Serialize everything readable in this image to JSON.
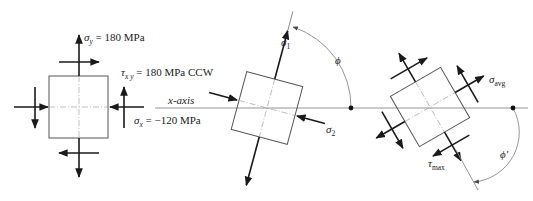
{
  "diagram": {
    "original_element": {
      "sigma_y_label": "σ",
      "sigma_y_sub": "y",
      "sigma_y_value": " = 180 MPa",
      "tau_xy_label": "τ",
      "tau_xy_sub": "x y",
      "tau_xy_value": " = 180 MPa CCW",
      "sigma_x_label": "σ",
      "sigma_x_sub": "x",
      "sigma_x_value": " = −120 MPa"
    },
    "axis": {
      "label": "x-axis"
    },
    "principal_element": {
      "sigma1_label": "σ",
      "sigma1_sub": "1",
      "sigma2_label": "σ",
      "sigma2_sub": "2",
      "angle_label": "ϕ"
    },
    "shear_element": {
      "sigma_avg_label": "σ",
      "sigma_avg_sub": "avg",
      "tau_max_label": "τ",
      "tau_max_sub": "max",
      "angle_label": "ϕ",
      "angle_prime": "′"
    },
    "colors": {
      "ink": "#1a1a1a",
      "element_outline": "#555555",
      "guide_lines": "#999999"
    }
  }
}
